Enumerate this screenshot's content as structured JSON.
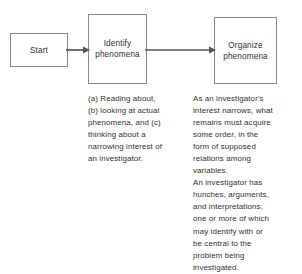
{
  "diagram": {
    "line_color": "#8a8a8a",
    "arrow_color": "#555555",
    "text_color": "#303030",
    "background": "#ffffff",
    "nodes": [
      {
        "id": "start",
        "label": "Start"
      },
      {
        "id": "identify",
        "label": "Identify\nphenomena"
      },
      {
        "id": "organize",
        "label": "Organize\nphenomena"
      }
    ],
    "connectors": [
      {
        "id": "start-to-identify",
        "from": "start",
        "to": "identify",
        "style": "solid-arrow"
      },
      {
        "id": "identify-to-organize",
        "from": "identify",
        "to": "organize",
        "style": "solid-arrow"
      }
    ],
    "notes": [
      {
        "id": "identify-note",
        "for": "identify",
        "text": "(a) Reading about,\n(b) looking at actual\nphenomena, and (c)\nthinking about a\nnarrowing interest of\nan investigator."
      },
      {
        "id": "organize-note",
        "for": "organize",
        "text": "As an investigator's\ninterest narrows, what\nremains must acquire\nsome order, in the\nform of supposed\nrelations among\nvariables.\nAn investigator has\nhunches, arguments,\nand interpretations,\none or more of which\nmay identify with or\nbe central to the\nproblem being\ninvestigated."
      }
    ]
  }
}
